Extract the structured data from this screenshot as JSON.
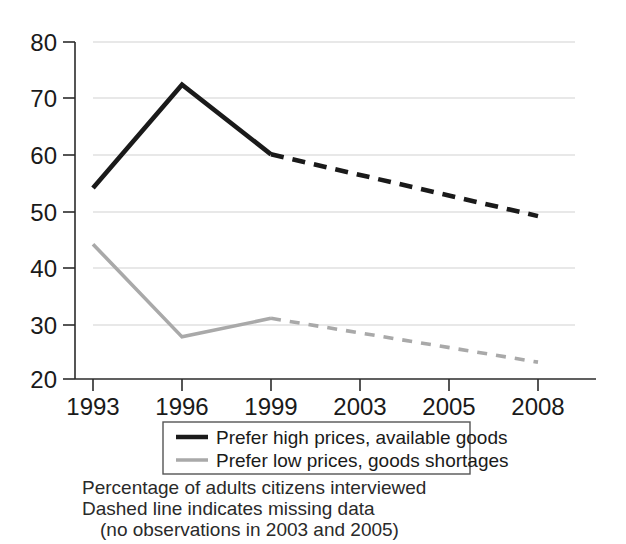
{
  "chart_data": {
    "type": "line",
    "title": "",
    "xlabel": "",
    "ylabel": "",
    "categories": [
      "1993",
      "1996",
      "1999",
      "2003",
      "2005",
      "2008"
    ],
    "ylim": [
      20,
      80
    ],
    "yticks": [
      20,
      30,
      40,
      50,
      60,
      70,
      80
    ],
    "grid": true,
    "legend_position": "below-axes",
    "series": [
      {
        "name": "Prefer high prices, available goods",
        "color": "#1a1a1a",
        "values": [
          54,
          72.4,
          60,
          null,
          null,
          49
        ],
        "solid_segment": [
          "1993",
          "1996",
          "1999"
        ],
        "dashed_segment": [
          "1999",
          "2008"
        ],
        "dashed_note": "no observations in 2003 and 2005"
      },
      {
        "name": "Prefer low prices, goods shortages",
        "color": "#a9a9a9",
        "values": [
          44,
          27.5,
          30.8,
          null,
          null,
          23
        ],
        "solid_segment": [
          "1993",
          "1996",
          "1999"
        ],
        "dashed_segment": [
          "1999",
          "2008"
        ],
        "dashed_note": "no observations in 2003 and 2005"
      }
    ],
    "annotations": [
      "Percentage of adults citizens interviewed",
      "Dashed line indicates missing data",
      "(no observations in 2003 and 2005)"
    ]
  },
  "axes": {
    "ytick_labels": [
      "80",
      "70",
      "60",
      "50",
      "40",
      "30",
      "20"
    ],
    "xtick_labels": [
      "1993",
      "1996",
      "1999",
      "2003",
      "2005",
      "2008"
    ]
  },
  "legend": {
    "entries": [
      {
        "label": "Prefer high prices, available goods",
        "color": "#1a1a1a"
      },
      {
        "label": "Prefer low prices, goods shortages",
        "color": "#a9a9a9"
      }
    ]
  },
  "caption": {
    "line1": "Percentage of adults citizens interviewed",
    "line2": "Dashed line indicates missing data",
    "line3": "(no observations in 2003 and 2005)"
  },
  "colors": {
    "series_high": "#1a1a1a",
    "series_low": "#a9a9a9",
    "gridline": "#d2d2d2",
    "axis": "#2b2b2b",
    "background": "#ffffff"
  }
}
